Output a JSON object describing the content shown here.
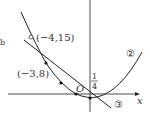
{
  "figure": {
    "axis_label_x": "x",
    "origin_label": "O",
    "fraction": {
      "numerator": "1",
      "denominator": "4"
    },
    "curve_labels": {
      "parabola": "②",
      "line": "③"
    },
    "point_labels": [
      {
        "text": "(−4,15)",
        "point": [
          -4,
          15
        ],
        "marker": "open"
      },
      {
        "text": "(−3,8)",
        "point": [
          -3,
          8
        ],
        "marker": "filled"
      }
    ],
    "marked_points": [
      {
        "x": -3,
        "y": 8
      },
      {
        "x": -2,
        "y": 3
      },
      {
        "x": -1,
        "y": 0
      },
      {
        "x": 0,
        "y": -1
      }
    ],
    "stray_mark": "b",
    "colors": {
      "stroke": "#222222",
      "text": "#333333"
    }
  }
}
